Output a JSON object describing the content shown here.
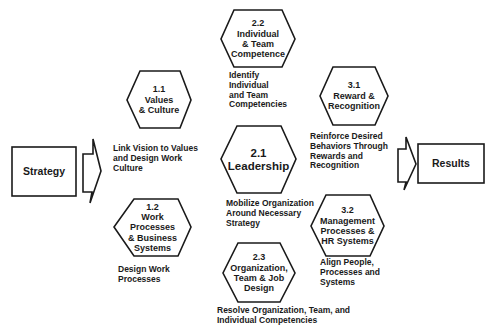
{
  "diagram": {
    "input": {
      "label": "Strategy"
    },
    "output": {
      "label": "Results"
    },
    "nodes": [
      {
        "id": "1.1",
        "number": "1.1",
        "title_lines": [
          "Values",
          "& Culture"
        ],
        "description_lines": [
          "Link Vision to Values",
          "and Design Work",
          "Culture"
        ]
      },
      {
        "id": "1.2",
        "number": "1.2",
        "title_lines": [
          "Work",
          "Processes",
          "& Business",
          "Systems"
        ],
        "description_lines": [
          "Design Work",
          "Processes"
        ]
      },
      {
        "id": "2.1",
        "number": "2.1",
        "title_lines": [
          "Leadership"
        ],
        "description_lines": [
          "Mobilize Organization",
          "Around Necessary",
          "Strategy"
        ]
      },
      {
        "id": "2.2",
        "number": "2.2",
        "title_lines": [
          "Individual",
          "& Team",
          "Competence"
        ],
        "description_lines": [
          "Identify",
          "Individual",
          "and Team",
          "Competencies"
        ]
      },
      {
        "id": "2.3",
        "number": "2.3",
        "title_lines": [
          "Organization,",
          "Team & Job",
          "Design"
        ],
        "description_lines": [
          "Resolve Organization, Team, and",
          "Individual Competencies"
        ]
      },
      {
        "id": "3.1",
        "number": "3.1",
        "title_lines": [
          "Reward &",
          "Recognition"
        ],
        "description_lines": [
          "Reinforce Desired",
          "Behaviors Through",
          "Rewards and",
          "Recognition"
        ]
      },
      {
        "id": "3.2",
        "number": "3.2",
        "title_lines": [
          "Management",
          "Processes &",
          "HR Systems"
        ],
        "description_lines": [
          "Align People,",
          "Processes and",
          "Systems"
        ]
      }
    ]
  },
  "colors": {
    "stroke": "#1a1a1a",
    "background": "#ffffff"
  }
}
